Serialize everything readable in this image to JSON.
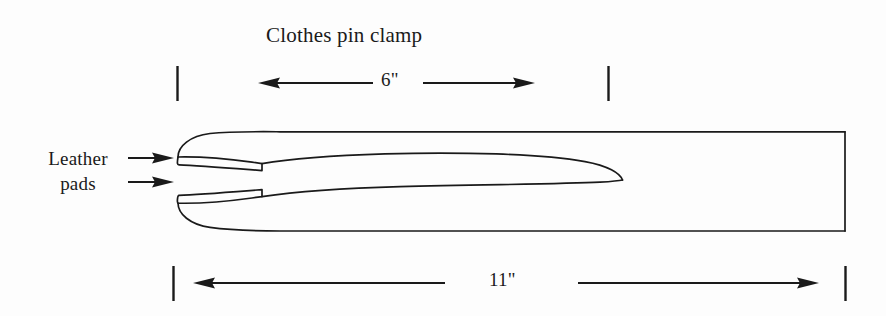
{
  "page": {
    "background_color": "#fdfdfd",
    "ink_color": "#1a1a1a",
    "width": 886,
    "height": 316
  },
  "title": {
    "text": "Clothes pin clamp"
  },
  "dimensions": {
    "upper": {
      "label": "6\"",
      "name": "jaw-opening-length",
      "tick_left_x": 177,
      "tick_right_x": 608,
      "line_y": 83
    },
    "lower": {
      "label": "11\"",
      "name": "overall-length",
      "tick_left_x": 173,
      "tick_right_x": 846,
      "line_y": 283
    }
  },
  "annotations": {
    "leather_pads": {
      "line1": "Leather",
      "line2": "pads",
      "leader_count": 2,
      "leader_top_y": 158,
      "leader_bottom_y": 182
    }
  },
  "drawing": {
    "name": "clothes-pin-clamp",
    "body_left_x": 176,
    "body_right_x": 846,
    "body_top_y": 132,
    "body_bottom_y": 231,
    "lens_tip_x": 622,
    "lens_center_y": 180,
    "pad_end_x": 262
  }
}
